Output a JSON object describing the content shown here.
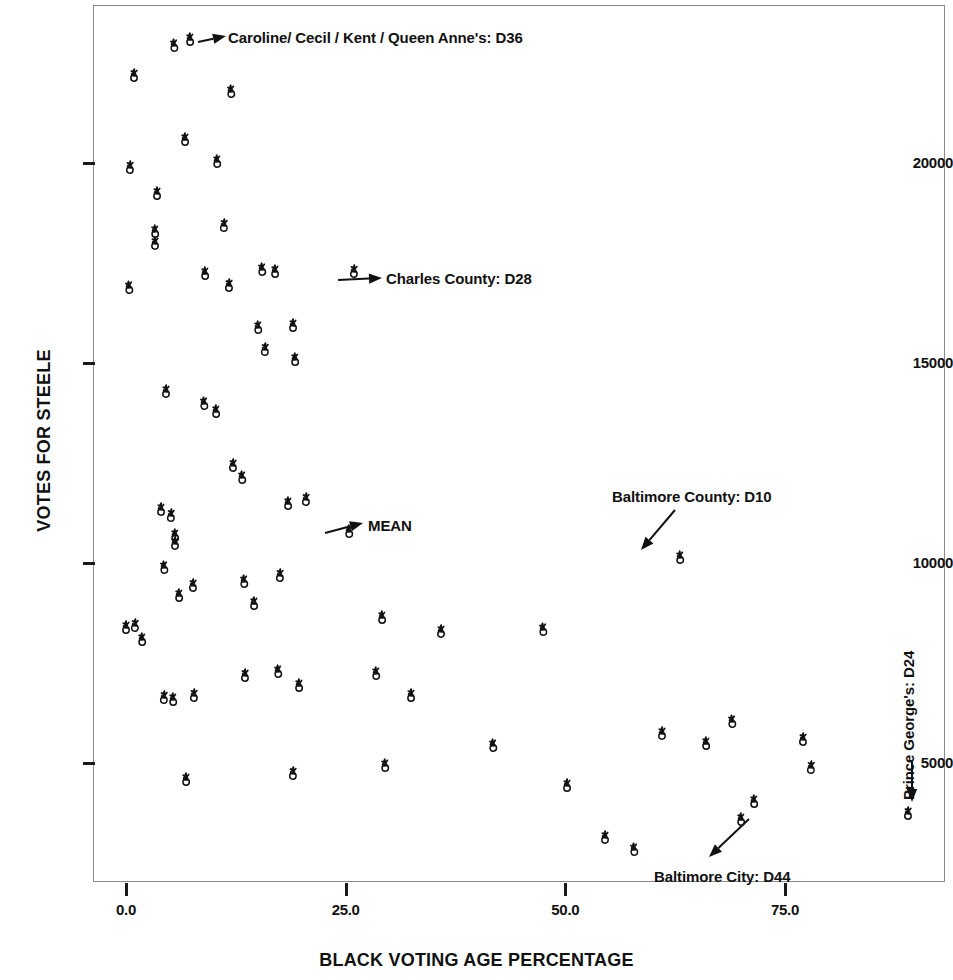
{
  "chart_data": {
    "type": "scatter",
    "title": "",
    "xlabel": "BLACK VOTING AGE PERCENTAGE",
    "ylabel": "VOTES FOR STEELE",
    "xlim": [
      -2.0,
      95.0
    ],
    "ylim": [
      1700,
      23500
    ],
    "xticks": [
      "0.0",
      "25.0",
      "50.0",
      "75.0"
    ],
    "xtick_values": [
      0.0,
      25.0,
      50.0,
      75.0
    ],
    "yticks": [
      "5000",
      "10000",
      "15000",
      "20000"
    ],
    "ytick_values": [
      5000,
      10000,
      15000,
      20000
    ],
    "grid": false,
    "legend": "none",
    "marker": "scatter-glyph",
    "points": [
      {
        "x": 5.5,
        "y": 22950
      },
      {
        "x": 7.3,
        "y": 23100
      },
      {
        "x": 0.9,
        "y": 22200
      },
      {
        "x": 12.0,
        "y": 21800
      },
      {
        "x": 6.7,
        "y": 20600
      },
      {
        "x": 0.5,
        "y": 19900
      },
      {
        "x": 10.4,
        "y": 20050
      },
      {
        "x": 3.5,
        "y": 19250
      },
      {
        "x": 11.2,
        "y": 18450
      },
      {
        "x": 3.3,
        "y": 18300
      },
      {
        "x": 3.3,
        "y": 18000
      },
      {
        "x": 0.3,
        "y": 16900
      },
      {
        "x": 9.0,
        "y": 17250
      },
      {
        "x": 11.7,
        "y": 16950
      },
      {
        "x": 15.5,
        "y": 17350
      },
      {
        "x": 17.0,
        "y": 17300
      },
      {
        "x": 26.0,
        "y": 17300
      },
      {
        "x": 15.0,
        "y": 15900
      },
      {
        "x": 19.0,
        "y": 15950
      },
      {
        "x": 15.8,
        "y": 15350
      },
      {
        "x": 19.2,
        "y": 15100
      },
      {
        "x": 4.5,
        "y": 14300
      },
      {
        "x": 8.9,
        "y": 14000
      },
      {
        "x": 10.2,
        "y": 13800
      },
      {
        "x": 12.2,
        "y": 12450
      },
      {
        "x": 13.2,
        "y": 12150
      },
      {
        "x": 18.4,
        "y": 11500
      },
      {
        "x": 20.5,
        "y": 11600
      },
      {
        "x": 25.4,
        "y": 10800
      },
      {
        "x": 4.0,
        "y": 11350
      },
      {
        "x": 5.1,
        "y": 11200
      },
      {
        "x": 5.6,
        "y": 10700
      },
      {
        "x": 5.6,
        "y": 10500
      },
      {
        "x": 4.3,
        "y": 9900
      },
      {
        "x": 6.0,
        "y": 9200
      },
      {
        "x": 7.6,
        "y": 9450
      },
      {
        "x": 13.4,
        "y": 9550
      },
      {
        "x": 14.6,
        "y": 9000
      },
      {
        "x": 17.5,
        "y": 9700
      },
      {
        "x": 63.0,
        "y": 10150
      },
      {
        "x": 0.0,
        "y": 8400
      },
      {
        "x": 1.0,
        "y": 8450
      },
      {
        "x": 1.8,
        "y": 8100
      },
      {
        "x": 35.9,
        "y": 8300
      },
      {
        "x": 47.5,
        "y": 8350
      },
      {
        "x": 29.1,
        "y": 8650
      },
      {
        "x": 13.5,
        "y": 7200
      },
      {
        "x": 17.3,
        "y": 7300
      },
      {
        "x": 19.7,
        "y": 6950
      },
      {
        "x": 7.7,
        "y": 6700
      },
      {
        "x": 28.4,
        "y": 7250
      },
      {
        "x": 32.4,
        "y": 6700
      },
      {
        "x": 4.3,
        "y": 6650
      },
      {
        "x": 5.3,
        "y": 6600
      },
      {
        "x": 61.0,
        "y": 5750
      },
      {
        "x": 69.0,
        "y": 6050
      },
      {
        "x": 66.0,
        "y": 5500
      },
      {
        "x": 77.0,
        "y": 5600
      },
      {
        "x": 41.8,
        "y": 5450
      },
      {
        "x": 6.8,
        "y": 4600
      },
      {
        "x": 19.0,
        "y": 4750
      },
      {
        "x": 29.5,
        "y": 4950
      },
      {
        "x": 50.2,
        "y": 4450
      },
      {
        "x": 78.0,
        "y": 4900
      },
      {
        "x": 71.5,
        "y": 4050
      },
      {
        "x": 54.5,
        "y": 3150
      },
      {
        "x": 57.8,
        "y": 2850
      },
      {
        "x": 70.0,
        "y": 3600
      },
      {
        "x": 89.0,
        "y": 3750
      }
    ],
    "annotations": [
      {
        "id": "caroline-cecil-kent-queen-annes",
        "label": "Caroline/ Cecil / Kent / Queen Anne's: D36",
        "target_x": 7.3,
        "target_y": 23100
      },
      {
        "id": "charles-county",
        "label": "Charles County: D28",
        "target_x": 26.0,
        "target_y": 17300
      },
      {
        "id": "mean",
        "label": "MEAN",
        "target_x": 25.4,
        "target_y": 10800
      },
      {
        "id": "baltimore-county",
        "label": "Baltimore County: D10",
        "target_x": 63.0,
        "target_y": 10150
      },
      {
        "id": "baltimore-city",
        "label": "Baltimore City: D44",
        "target_x": 70.0,
        "target_y": 3600
      },
      {
        "id": "prince-georges",
        "label": "Prince George's: D24",
        "target_x": 89.0,
        "target_y": 3750
      }
    ]
  }
}
